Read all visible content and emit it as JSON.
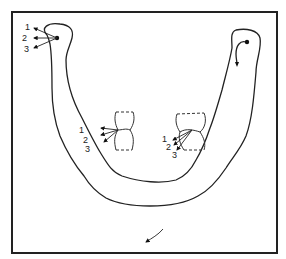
{
  "figure": {
    "left_condyle": {
      "labels": [
        "1",
        "2",
        "3"
      ]
    },
    "left_teeth": {
      "labels": [
        "1",
        "2",
        "3"
      ]
    },
    "right_teeth": {
      "labels": [
        "1",
        "2",
        "3"
      ]
    },
    "colors": {
      "line": "#222222",
      "background": "#ffffff"
    }
  }
}
